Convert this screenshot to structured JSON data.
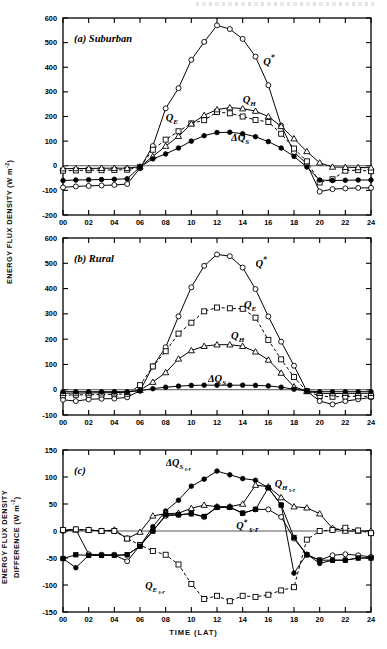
{
  "figure": {
    "axis_titles": {
      "y_main": "ENERGY FLUX DENSITY (W m-2)",
      "y_diff_line1": "ENERGY FLUX DENSITY",
      "y_diff_line2": "DIFFERENCE (W m-2)",
      "x": "TIME (LAT)"
    },
    "panel_labels": {
      "a": "(a)  Suburban",
      "b": "(b)  Rural",
      "c": "(c)"
    }
  },
  "chart_data": [
    {
      "type": "line",
      "panel": "a",
      "title": "(a)  Suburban",
      "xlabel": "TIME (LAT)",
      "ylabel": "ENERGY FLUX DENSITY (W m-2)",
      "xlim": [
        0,
        24
      ],
      "ylim": [
        -200,
        600
      ],
      "ytick_step": 100,
      "xtick_step": 2,
      "xtick_labels": [
        "00",
        "02",
        "04",
        "06",
        "08",
        "10",
        "12",
        "14",
        "16",
        "18",
        "20",
        "22",
        "24"
      ],
      "ytick_labels": [
        "600",
        "500",
        "400",
        "300",
        "200",
        "100",
        "0",
        "-100",
        "-200"
      ],
      "grid": false,
      "legend": "inline-annotations",
      "x": [
        0,
        1,
        2,
        3,
        4,
        5,
        6,
        7,
        8,
        9,
        10,
        11,
        12,
        13,
        14,
        15,
        16,
        17,
        18,
        19,
        20,
        21,
        22,
        23,
        24
      ],
      "series": [
        {
          "name": "Q*",
          "label": "Q*",
          "marker": "open-circle",
          "line": "solid",
          "values": [
            -88,
            -84,
            -82,
            -80,
            -78,
            -74,
            -10,
            80,
            233,
            315,
            430,
            503,
            570,
            555,
            515,
            443,
            327,
            163,
            55,
            8,
            -105,
            -95,
            -92,
            -90,
            -90
          ]
        },
        {
          "name": "QE",
          "label": "QE",
          "marker": "open-square",
          "line": "dashed",
          "values": [
            -20,
            -19,
            -18,
            -18,
            -17,
            -16,
            -6,
            65,
            106,
            140,
            172,
            185,
            218,
            213,
            200,
            186,
            178,
            130,
            70,
            18,
            -68,
            -55,
            -20,
            -18,
            -22
          ]
        },
        {
          "name": "QH",
          "label": "QH",
          "marker": "open-triangle",
          "line": "solid",
          "values": [
            -12,
            -11,
            -11,
            -10,
            -10,
            -10,
            -4,
            38,
            80,
            120,
            170,
            205,
            228,
            236,
            232,
            222,
            200,
            160,
            110,
            58,
            12,
            -5,
            -6,
            -7,
            -8
          ]
        },
        {
          "name": "dQS",
          "label": "ΔQS",
          "marker": "filled-circle",
          "line": "solid",
          "values": [
            -60,
            -58,
            -57,
            -56,
            -55,
            -53,
            -5,
            28,
            48,
            72,
            100,
            122,
            135,
            136,
            130,
            118,
            98,
            72,
            38,
            -5,
            -58,
            -60,
            -59,
            -58,
            -58
          ]
        }
      ]
    },
    {
      "type": "line",
      "panel": "b",
      "title": "(b)  Rural",
      "xlabel": "TIME (LAT)",
      "ylabel": "ENERGY FLUX DENSITY (W m-2)",
      "xlim": [
        0,
        24
      ],
      "ylim": [
        -100,
        600
      ],
      "ytick_step": 100,
      "xtick_step": 2,
      "xtick_labels": [
        "00",
        "02",
        "04",
        "06",
        "08",
        "10",
        "12",
        "14",
        "16",
        "18",
        "20",
        "22",
        "24"
      ],
      "ytick_labels": [
        "600",
        "500",
        "400",
        "300",
        "200",
        "100",
        "0",
        "-100"
      ],
      "grid": false,
      "legend": "inline-annotations",
      "x": [
        0,
        1,
        2,
        3,
        4,
        5,
        6,
        7,
        8,
        9,
        10,
        11,
        12,
        13,
        14,
        15,
        16,
        17,
        18,
        19,
        20,
        21,
        22,
        23,
        24
      ],
      "series": [
        {
          "name": "Q*",
          "label": "Q*",
          "marker": "open-circle",
          "line": "solid",
          "values": [
            -40,
            -45,
            -38,
            -36,
            -35,
            -30,
            -4,
            92,
            168,
            290,
            405,
            490,
            535,
            528,
            483,
            398,
            290,
            190,
            95,
            -5,
            -45,
            -58,
            -45,
            -38,
            -30
          ]
        },
        {
          "name": "QE",
          "label": "QE",
          "marker": "open-square",
          "line": "dashed",
          "values": [
            -22,
            -20,
            -20,
            -19,
            -18,
            -16,
            18,
            92,
            152,
            222,
            265,
            310,
            325,
            322,
            320,
            285,
            197,
            120,
            50,
            -6,
            -25,
            -28,
            -27,
            -26,
            -26
          ]
        },
        {
          "name": "QH",
          "label": "QH",
          "marker": "open-triangle",
          "line": "solid",
          "values": [
            -14,
            -13,
            -13,
            -12,
            -12,
            -10,
            -2,
            30,
            68,
            122,
            155,
            172,
            178,
            178,
            172,
            150,
            118,
            66,
            12,
            -6,
            -14,
            -15,
            -14,
            -14,
            -14
          ]
        },
        {
          "name": "dQS",
          "label": "ΔQS",
          "marker": "filled-circle",
          "line": "solid",
          "values": [
            -8,
            -8,
            -8,
            -8,
            -8,
            -8,
            -4,
            4,
            10,
            14,
            17,
            18,
            18,
            18,
            18,
            17,
            15,
            10,
            2,
            -5,
            -8,
            -8,
            -8,
            -8,
            -8
          ]
        }
      ]
    },
    {
      "type": "line",
      "panel": "c",
      "title": "(c)",
      "xlabel": "TIME (LAT)",
      "ylabel": "ENERGY FLUX DENSITY DIFFERENCE (W m-2)",
      "xlim": [
        0,
        24
      ],
      "ylim": [
        -150,
        150
      ],
      "ytick_step": 50,
      "xtick_step": 2,
      "xtick_labels": [
        "00",
        "02",
        "04",
        "06",
        "08",
        "10",
        "12",
        "14",
        "16",
        "18",
        "20",
        "22",
        "24"
      ],
      "ytick_labels": [
        "150",
        "100",
        "50",
        "0",
        "-50",
        "-100",
        "-150"
      ],
      "grid": false,
      "legend": "inline-annotations",
      "x": [
        0,
        1,
        2,
        3,
        4,
        5,
        6,
        7,
        8,
        9,
        10,
        11,
        12,
        13,
        14,
        15,
        16,
        17,
        18,
        19,
        20,
        21,
        22,
        23,
        24
      ],
      "series": [
        {
          "name": "dQS_s-r",
          "label": "ΔQS s-r",
          "marker": "filled-circle",
          "line": "solid",
          "values": [
            -51,
            -68,
            -45,
            -45,
            -45,
            -44,
            -28,
            8,
            37,
            57,
            83,
            96,
            111,
            104,
            97,
            94,
            80,
            48,
            -78,
            -43,
            -60,
            -54,
            -54,
            -50,
            -50
          ]
        },
        {
          "name": "QH_s-r",
          "label": "QH s-r",
          "marker": "open-triangle",
          "line": "solid",
          "values": [
            2,
            2,
            2,
            0,
            2,
            -14,
            -2,
            28,
            32,
            33,
            42,
            48,
            45,
            45,
            50,
            85,
            82,
            62,
            45,
            43,
            32,
            5,
            0,
            0,
            0
          ]
        },
        {
          "name": "Q*_s-r",
          "label": "Q* s-r",
          "marker": "open-circle",
          "line": "solid",
          "values": [
            0,
            3,
            -43,
            -44,
            -44,
            -56,
            -27,
            0,
            28,
            30,
            32,
            26,
            44,
            44,
            33,
            40,
            40,
            26,
            -14,
            -44,
            -54,
            -45,
            -43,
            -45,
            -48
          ]
        },
        {
          "name": "QE_s-r",
          "label": "QE s-r",
          "marker": "open-square",
          "line": "dashed",
          "values": [
            2,
            3,
            2,
            0,
            0,
            -14,
            -26,
            -37,
            -44,
            -62,
            -98,
            -126,
            -120,
            -130,
            -120,
            -122,
            -118,
            -110,
            -104,
            -16,
            0,
            2,
            6,
            1,
            -4
          ]
        },
        {
          "name": "mixed_filled_square",
          "label": "",
          "marker": "filled-square",
          "line": "solid",
          "values": [
            -51,
            -44,
            -45,
            -45,
            -45,
            -44,
            -28,
            0,
            30,
            30,
            32,
            27,
            44,
            44,
            33,
            40,
            80,
            48,
            -12,
            -44,
            -54,
            -54,
            -54,
            -50,
            -50
          ]
        }
      ]
    }
  ]
}
